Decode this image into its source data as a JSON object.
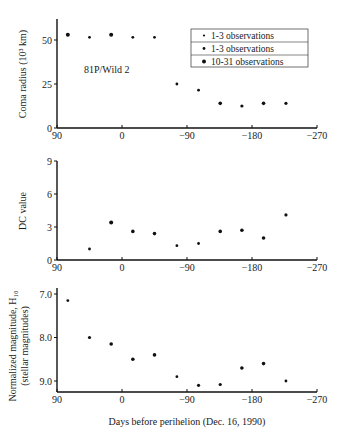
{
  "chart_data": [
    {
      "type": "scatter",
      "title": "",
      "annotation": "81P/Wild 2",
      "xlabel": "",
      "ylabel": "Coma radius (10³ km)",
      "xlim": [
        90,
        -270
      ],
      "ylim": [
        0,
        62
      ],
      "xticks": [
        90,
        0,
        -90,
        -180,
        -270
      ],
      "yticks": [
        0,
        25,
        50
      ],
      "legend": {
        "position": "upper right",
        "entries": [
          "1-3 observations",
          "1-3 observations",
          "10-31 observations"
        ]
      },
      "x": [
        75,
        45,
        15,
        -15,
        -45,
        -76,
        -106,
        -136,
        -166,
        -196,
        -227
      ],
      "values": [
        53,
        51.5,
        53,
        51.5,
        51.5,
        25,
        21.5,
        14,
        12.5,
        14,
        14
      ]
    },
    {
      "type": "scatter",
      "title": "",
      "xlabel": "",
      "ylabel": "DC value",
      "xlim": [
        90,
        -270
      ],
      "ylim": [
        0,
        9
      ],
      "xticks": [
        90,
        0,
        -90,
        -180,
        -270
      ],
      "yticks": [
        0,
        3,
        6,
        9
      ],
      "x": [
        45,
        15,
        -15,
        -45,
        -76,
        -106,
        -136,
        -166,
        -196,
        -227
      ],
      "values": [
        1.0,
        3.4,
        2.6,
        2.4,
        1.3,
        1.5,
        2.6,
        2.7,
        2.0,
        4.1
      ]
    },
    {
      "type": "scatter",
      "title": "",
      "xlabel": "Days before perihelion (Dec. 16, 1990)",
      "ylabel": "Normalized magnitude, H₁₀ (stellar magnitudes)",
      "ylabel_line1": "Normalized magnitude, H₁₀",
      "ylabel_line2": "(stellar magnitudes)",
      "xlim": [
        90,
        -270
      ],
      "ylim": [
        9.25,
        6.85
      ],
      "y_inverted": true,
      "xticks": [
        90,
        0,
        -90,
        -180,
        -270
      ],
      "yticks": [
        7.0,
        8.0,
        9.0
      ],
      "x": [
        75,
        45,
        15,
        -15,
        -45,
        -76,
        -106,
        -136,
        -166,
        -196,
        -227
      ],
      "values": [
        7.15,
        8.0,
        8.15,
        8.5,
        8.4,
        8.9,
        9.1,
        9.08,
        8.7,
        8.6,
        9.0
      ]
    }
  ],
  "labels": {
    "panel1_ylabel": "Coma radius (10³ km)",
    "panel1_annotation": "81P/Wild 2",
    "panel2_ylabel": "DC value",
    "panel3_ylabel_line1": "Normalized magnitude, H₁₀",
    "panel3_ylabel_line2": "(stellar magnitudes)",
    "xlabel": "Days before perihelion (Dec. 16, 1990)",
    "legend": [
      "1-3 observations",
      "1-3 observations",
      "10-31 observations"
    ]
  }
}
